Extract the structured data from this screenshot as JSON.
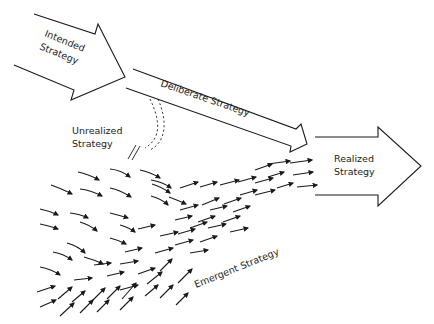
{
  "diagram": {
    "type": "strategy-formation",
    "colors": {
      "stroke": "#1a1a1a",
      "text": "#222222",
      "background": "#ffffff"
    },
    "nodes": [
      {
        "id": "intended",
        "label_lines": [
          "Intended",
          "Strategy"
        ],
        "shape": "block-arrow"
      },
      {
        "id": "deliberate",
        "label": "Deliberate Strategy",
        "shape": "long-arrow"
      },
      {
        "id": "unrealized",
        "label_lines": [
          "Unrealized",
          "Strategy"
        ],
        "shape": "dashed-curved-arrow-blocked"
      },
      {
        "id": "realized",
        "label_lines": [
          "Realized",
          "Strategy"
        ],
        "shape": "block-arrow"
      },
      {
        "id": "emergent",
        "label": "Emergent Strategy",
        "shape": "arrow-field"
      }
    ],
    "edges": [
      {
        "from": "intended",
        "to": "deliberate"
      },
      {
        "from": "intended",
        "to": "unrealized",
        "style": "dashed"
      },
      {
        "from": "deliberate",
        "to": "realized"
      },
      {
        "from": "emergent",
        "to": "realized"
      }
    ]
  },
  "labels": {
    "intended_1": "Intended",
    "intended_2": "Strategy",
    "deliberate": "Deliberate Strategy",
    "unrealized_1": "Unrealized",
    "unrealized_2": "Strategy",
    "realized_1": "Realized",
    "realized_2": "Strategy",
    "emergent": "Emergent Strategy"
  }
}
